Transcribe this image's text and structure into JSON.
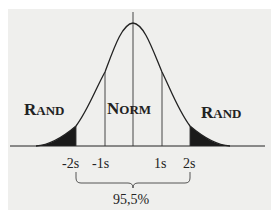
{
  "diagram": {
    "type": "normal-distribution",
    "regions": {
      "left_tail": "RAND",
      "center": "NORM",
      "right_tail": "RAND"
    },
    "region_labels_smallcaps": {
      "left": {
        "first": "R",
        "rest": "AND"
      },
      "center": {
        "first": "N",
        "rest": "ORM"
      },
      "right": {
        "first": "R",
        "rest": "AND"
      }
    },
    "axis_ticks": [
      "-2s",
      "-1s",
      "1s",
      "2s"
    ],
    "bracket_label": "95,5%",
    "colors": {
      "background": "#efefed",
      "ink": "#222222"
    }
  }
}
